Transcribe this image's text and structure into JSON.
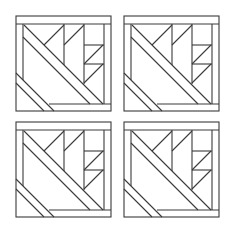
{
  "diagram": {
    "title": "",
    "stroke_color": "#3a3a3a",
    "background": "#ffffff",
    "blocks": [
      {
        "id": "top-left",
        "x": 16,
        "y": 16
      },
      {
        "id": "top-right",
        "x": 124,
        "y": 16
      },
      {
        "id": "bottom-left",
        "x": 16,
        "y": 122
      },
      {
        "id": "bottom-right",
        "x": 124,
        "y": 122
      }
    ]
  }
}
